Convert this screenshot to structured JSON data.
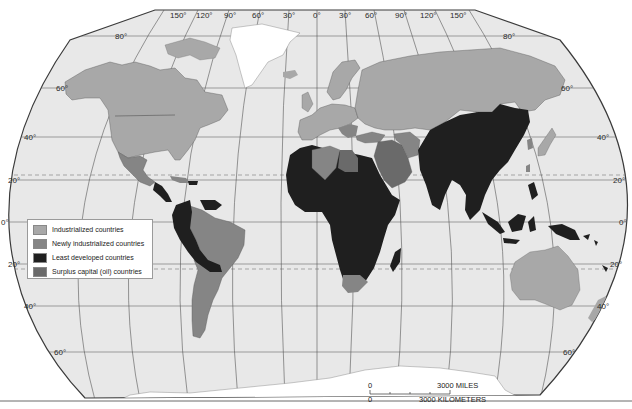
{
  "map": {
    "projection": "Robinson-style world map",
    "colors": {
      "ocean": "#e8e8e8",
      "frame": "#3a3a3a",
      "graticule": "#555555",
      "ice": "#ffffff",
      "industrialized": "#a8a8a8",
      "newly_industrialized": "#858585",
      "least_developed": "#1f1f1f",
      "surplus_oil": "#6a6a6a"
    },
    "longitude_labels": [
      "150°",
      "120°",
      "90°",
      "60°",
      "30°",
      "0°",
      "30°",
      "60°",
      "90°",
      "120°",
      "150°"
    ],
    "latitude_labels_left": [
      "80°",
      "60°",
      "40°",
      "20°",
      "0°",
      "20°",
      "40°",
      "60°"
    ],
    "latitude_labels_right": [
      "80°",
      "60°",
      "40°",
      "20°",
      "0°",
      "20°",
      "40°",
      "60°"
    ]
  },
  "legend": {
    "items": [
      {
        "label": "Industrialized countries",
        "color": "#a8a8a8"
      },
      {
        "label": "Newly industrialized countries",
        "color": "#858585"
      },
      {
        "label": "Least developed countries",
        "color": "#1f1f1f"
      },
      {
        "label": "Surplus capital (oil) countries",
        "color": "#6a6a6a"
      }
    ]
  },
  "scale": {
    "miles_zero": "0",
    "miles_label": "3000  MILES",
    "km_zero": "0",
    "km_label": "3000  KILOMETERS"
  }
}
